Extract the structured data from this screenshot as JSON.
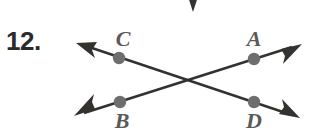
{
  "figure": {
    "problem_number": "12.",
    "colors": {
      "line": "#33322f",
      "dot": "#6e6e6e",
      "label": "#5a5a5a",
      "number": "#2b2b2b",
      "background": "#ffffff"
    },
    "labels": {
      "C": "C",
      "A": "A",
      "B": "B",
      "D": "D"
    },
    "geometry": {
      "intersection": {
        "x": 187,
        "y": 82
      },
      "points": [
        {
          "name": "C",
          "x": 119,
          "y": 58
        },
        {
          "name": "A",
          "x": 254,
          "y": 59
        },
        {
          "name": "B",
          "x": 120,
          "y": 102
        },
        {
          "name": "D",
          "x": 254,
          "y": 102
        }
      ],
      "lines": [
        {
          "name": "line-CD",
          "from": {
            "x": 76,
            "y": 43
          },
          "to": {
            "x": 300,
            "y": 118
          },
          "arrows": "both"
        },
        {
          "name": "line-BA",
          "from": {
            "x": 74,
            "y": 116
          },
          "to": {
            "x": 302,
            "y": 44
          },
          "arrows": "both"
        }
      ],
      "partial_arrow_top": {
        "x": 193,
        "y": 12,
        "direction": "down"
      }
    }
  }
}
